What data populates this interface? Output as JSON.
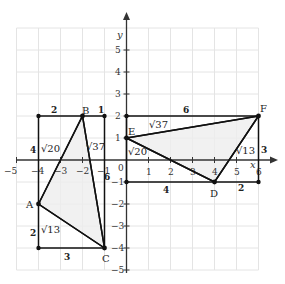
{
  "diagram": {
    "type": "coordinate-geometry",
    "origin_px": [
      126.5,
      160
    ],
    "unit_px": 22,
    "axes": {
      "x_label": "x",
      "y_label": "y",
      "x_ticks": [
        "−5",
        "−4",
        "−3",
        "−2",
        "−1",
        "1",
        "2",
        "3",
        "4",
        "5",
        "6"
      ],
      "y_ticks": [
        "−5",
        "−4",
        "−3",
        "−2",
        "−1",
        "1",
        "2",
        "3",
        "4",
        "5"
      ],
      "origin_label": "0"
    },
    "points": {
      "A": {
        "label": "A",
        "coords": [
          -4,
          -2
        ]
      },
      "B": {
        "label": "B",
        "coords": [
          -2,
          2
        ]
      },
      "C": {
        "label": "C",
        "coords": [
          -1,
          -4
        ]
      },
      "D": {
        "label": "D",
        "coords": [
          4,
          -1
        ]
      },
      "E": {
        "label": "E",
        "coords": [
          0,
          1
        ]
      },
      "F": {
        "label": "F",
        "coords": [
          6,
          2
        ]
      }
    },
    "triangle_abc": {
      "bounding_box_lengths": {
        "top_left": "2",
        "top_right": "1",
        "left_upper": "4",
        "left_lower": "2",
        "bottom": "3",
        "right": "6"
      },
      "side_lengths": {
        "AB": "√20",
        "BC": "√37",
        "AC": "√13"
      }
    },
    "triangle_def": {
      "bounding_box_lengths": {
        "top": "6",
        "right": "3",
        "bottom_left": "4",
        "bottom_right": "2"
      },
      "side_lengths": {
        "EF": "√37",
        "ED": "√20",
        "DF": "√13"
      }
    },
    "colors": {
      "grid": "#e4e4e4",
      "lines": "#111111",
      "fill": "#ededed"
    }
  }
}
